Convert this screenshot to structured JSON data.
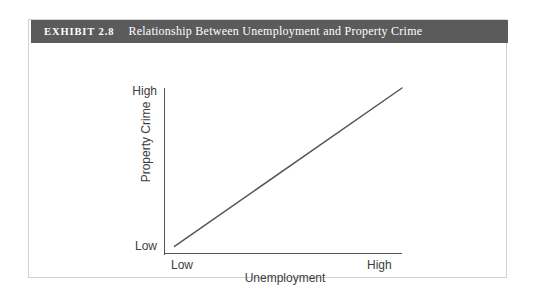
{
  "exhibit": {
    "number_label": "EXHIBIT 2.8",
    "title": "Relationship Between Unemployment and Property Crime",
    "header_bg_color": "#5b5b5b",
    "header_text_color": "#ffffff",
    "card_border_color": "#d2d2d2"
  },
  "chart_data": {
    "type": "line",
    "title": "Relationship Between Unemployment and Property Crime",
    "xlabel": "Unemployment",
    "ylabel": "Property Crime",
    "x_tick_labels": [
      "Low",
      "High"
    ],
    "y_tick_labels": [
      "Low",
      "High"
    ],
    "xlim": [
      0,
      1
    ],
    "ylim": [
      0,
      1
    ],
    "grid": false,
    "legend": "none",
    "line_color": "#555555",
    "axis_color": "#555555",
    "series": [
      {
        "name": "Property Crime vs Unemployment",
        "x": [
          0.04,
          1.0
        ],
        "y": [
          0.04,
          1.0
        ]
      }
    ],
    "annotation": "Positive linear relationship: as unemployment rises from Low to High, property crime rises from Low to High."
  }
}
